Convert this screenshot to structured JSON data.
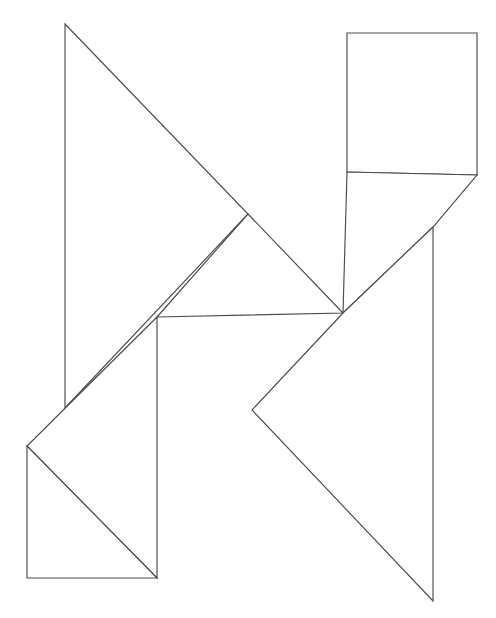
{
  "document": {
    "title": "Tangram Figure",
    "kind": "line-drawing",
    "description": "Black outline tangram dissection puzzle on white background",
    "canvas": {
      "width": 496,
      "height": 618,
      "background_color": "#ffffff"
    },
    "style": {
      "stroke_color": "#4a4a4a",
      "stroke_width": 1.15,
      "fill_color": "#ffffff"
    }
  },
  "figure": {
    "name": "tangram-outline",
    "piece_count": 7,
    "pieces": [
      {
        "id": "piece-1",
        "name": "large-triangle-left",
        "shape": "triangle",
        "points": "65,24 248,214 65,408"
      },
      {
        "id": "piece-2",
        "name": "large-triangle-center",
        "shape": "triangle",
        "points": "248,214 343,313 157,317"
      },
      {
        "id": "piece-3",
        "name": "medium-triangle-lower-left",
        "shape": "triangle",
        "points": "157,317 157,578 27,446"
      },
      {
        "id": "piece-4",
        "name": "small-square-bottom-left",
        "shape": "square",
        "points": "27,446 157,578 27,578"
      },
      {
        "id": "piece-5",
        "name": "parallelogram-upper-right",
        "shape": "parallelogram",
        "points": "347,33 477,33 477,175 347,172"
      },
      {
        "id": "piece-6",
        "name": "parallelogram-right",
        "shape": "parallelogram",
        "points": "347,172 477,175 433,227 343,313"
      },
      {
        "id": "piece-7",
        "name": "large-triangle-bottom-right",
        "shape": "triangle",
        "points": "343,313 433,227 433,601 252,410"
      }
    ],
    "outline": {
      "name": "figure-silhouette",
      "points": "65,24 248,214 347,172 347,33 477,33 477,175 433,227 433,601 252,410 157,578 27,578 27,446 65,408"
    },
    "interior_edges": [
      {
        "name": "edge-left-apex-to-center-right",
        "x1": 65,
        "y1": 24,
        "x2": 248,
        "y2": 214
      },
      {
        "name": "edge-center-right-to-center",
        "x1": 248,
        "y1": 214,
        "x2": 157,
        "y2": 317
      },
      {
        "name": "edge-center-right-to-lower-mid",
        "x1": 248,
        "y1": 214,
        "x2": 343,
        "y2": 313
      },
      {
        "name": "edge-center-vertical",
        "x1": 157,
        "y1": 317,
        "x2": 157,
        "y2": 578
      },
      {
        "name": "edge-center-to-left-point",
        "x1": 157,
        "y1": 317,
        "x2": 27,
        "y2": 446
      },
      {
        "name": "edge-square-diagonal",
        "x1": 27,
        "y1": 446,
        "x2": 157,
        "y2": 578
      },
      {
        "name": "edge-left-vertical",
        "x1": 65,
        "y1": 24,
        "x2": 65,
        "y2": 408
      },
      {
        "name": "edge-left-lower-diagonal",
        "x1": 65,
        "y1": 408,
        "x2": 27,
        "y2": 446
      },
      {
        "name": "edge-rect-left-vertical",
        "x1": 347,
        "y1": 33,
        "x2": 347,
        "y2": 313
      },
      {
        "name": "edge-rect-diagonal",
        "x1": 347,
        "y1": 172,
        "x2": 477,
        "y2": 33
      },
      {
        "name": "edge-right-vertical-upper",
        "x1": 477,
        "y1": 33,
        "x2": 477,
        "y2": 175
      },
      {
        "name": "edge-right-slant",
        "x1": 477,
        "y1": 175,
        "x2": 343,
        "y2": 313
      },
      {
        "name": "edge-right-vertical-lower",
        "x1": 433,
        "y1": 227,
        "x2": 433,
        "y2": 601
      },
      {
        "name": "edge-bottom-right-diagonal",
        "x1": 433,
        "y1": 601,
        "x2": 252,
        "y2": 410
      },
      {
        "name": "edge-mid-to-lower-mid",
        "x1": 252,
        "y1": 410,
        "x2": 343,
        "y2": 313
      },
      {
        "name": "edge-top-right-rect-top",
        "x1": 347,
        "y1": 33,
        "x2": 477,
        "y2": 33
      },
      {
        "name": "edge-square-bottom",
        "x1": 27,
        "y1": 578,
        "x2": 157,
        "y2": 578
      },
      {
        "name": "edge-square-left",
        "x1": 27,
        "y1": 446,
        "x2": 27,
        "y2": 578
      }
    ]
  }
}
